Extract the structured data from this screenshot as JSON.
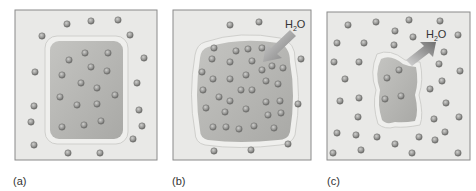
{
  "figure": {
    "panels": [
      {
        "id": "a",
        "label": "(a)",
        "description": "Cell in isotonic solution",
        "arrow": null
      },
      {
        "id": "b",
        "label": "(b)",
        "description": "Cell in hypotonic solution (swelling)",
        "arrow": {
          "label": "H2O",
          "direction": "in"
        }
      },
      {
        "id": "c",
        "label": "(c)",
        "description": "Cell in hypertonic solution (shrinking)",
        "arrow": {
          "label": "H2O",
          "direction": "out"
        }
      }
    ],
    "water_label_main": "H",
    "water_label_sub": "2",
    "water_label_end": "O"
  },
  "colors": {
    "background": "#e9e9e7",
    "border": "#8a8a8a",
    "cell_fill": "#b9b9b6",
    "membrane": "#d6d6d3",
    "particle": "#9a9a98",
    "arrow": "#8c8c8c"
  }
}
